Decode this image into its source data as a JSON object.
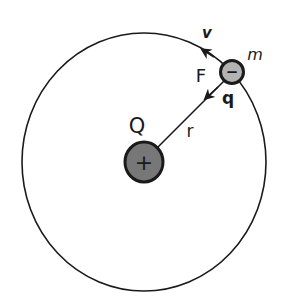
{
  "diagram": {
    "labels": {
      "velocity": "v",
      "force": "F",
      "mass": "m",
      "orbiting_charge": "q",
      "central_charge": "Q",
      "radius": "r"
    },
    "signs": {
      "nucleus": "+",
      "electron": "−"
    },
    "colors": {
      "stroke": "#1a1a1a",
      "nucleus_fill": "#777777",
      "electron_fill": "#b3b3b3",
      "background": "#ffffff"
    }
  }
}
